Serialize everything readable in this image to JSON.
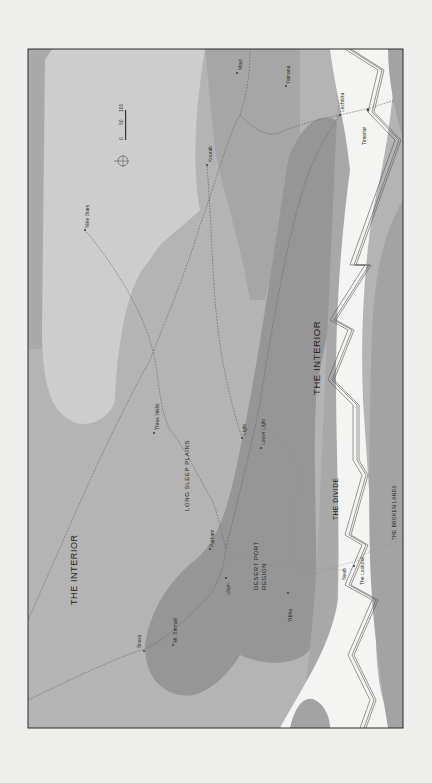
{
  "map": {
    "orientation": "rotated 90 degrees clockwise (text reads bottom-to-top)",
    "colors": {
      "page_background": "#eeeeed",
      "frame_border": "#2a2a2a",
      "zone_darkest": "#8e8e8e",
      "zone_dark": "#a3a3a3",
      "zone_mid": "#b4b4b4",
      "zone_light": "#cdcdcd",
      "divide_white": "#f4f4f2",
      "route_line": "#6a6a6a"
    },
    "regions": [
      {
        "name": "the-interior-west",
        "label": "THE INTERIOR"
      },
      {
        "name": "the-interior-east",
        "label": "THE INTERIOR"
      },
      {
        "name": "long-sleep-plains",
        "label": "LONG SLEEP PLAINS"
      },
      {
        "name": "desert-port-region",
        "label_line1": "DESERT PORT",
        "label_line2": "REGION"
      },
      {
        "name": "the-divide",
        "label": "THE DIVIDE"
      },
      {
        "name": "the-broken-lands",
        "label": "THE BROKEN LANDS"
      }
    ],
    "places": [
      {
        "name": "Nine Stars"
      },
      {
        "name": "Three Wells"
      },
      {
        "name": "Kourab"
      },
      {
        "name": "Mayr"
      },
      {
        "name": "Yamana"
      },
      {
        "name": "Lechnira"
      },
      {
        "name": "Tinterlar"
      },
      {
        "name": "Light"
      },
      {
        "name": "Lower Light"
      },
      {
        "name": "Parham"
      },
      {
        "name": "Ulum"
      },
      {
        "name": "Mt. Bimnah"
      },
      {
        "name": "Brava"
      },
      {
        "name": "Ytbha"
      },
      {
        "name": "Neeb"
      },
      {
        "name": "The Lookout"
      }
    ],
    "scale_bar": {
      "ticks": [
        "0",
        "50",
        "100"
      ]
    },
    "compass": {
      "icon": "compass-rose-icon"
    }
  }
}
